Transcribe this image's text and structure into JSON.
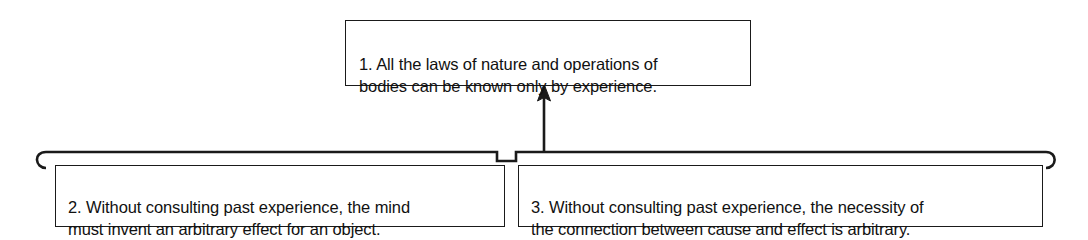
{
  "diagram": {
    "type": "argument-map",
    "title": "",
    "background_color": "#ffffff",
    "line_color": "#1a1a1a",
    "text_color": "#111111",
    "nodes": [
      {
        "id": "conclusion",
        "number": "1.",
        "role": "conclusion",
        "text": "1. All the laws of nature and operations of\nbodies can be known only by experience."
      },
      {
        "id": "premise-2",
        "number": "2.",
        "role": "premise",
        "text": "2. Without consulting past experience, the mind\nmust invent an arbitrary effect for an object."
      },
      {
        "id": "premise-3",
        "number": "3.",
        "role": "premise",
        "text": "3. Without consulting past experience, the necessity of\nthe connection between cause and effect is arbitrary."
      }
    ],
    "connectors": [
      {
        "id": "joint-bracket",
        "kind": "horizontal-bracket",
        "from": [
          "premise-2",
          "premise-3"
        ],
        "end_caps": "rounded-hook",
        "notch": "center-dip"
      },
      {
        "id": "inference-arrow",
        "kind": "arrow",
        "from": "joint-bracket",
        "to": "conclusion",
        "direction": "up",
        "arrowhead": "solid-filled"
      }
    ]
  }
}
